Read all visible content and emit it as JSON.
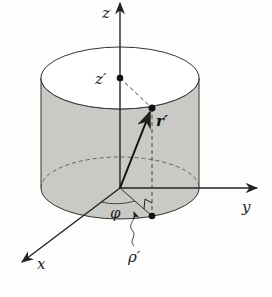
{
  "figure": {
    "type": "cylindrical-coordinates-diagram",
    "labels": {
      "z_axis": "z",
      "y_axis": "y",
      "x_axis": "x",
      "z_prime": "z′",
      "r_prime": "r′",
      "phi": "φ",
      "rho_prime": "ρ′"
    },
    "colors": {
      "background": "#fdfdfb",
      "cylinder_fill": "#c9c9c6",
      "top_fill": "#ffffff",
      "line": "#222222"
    }
  }
}
